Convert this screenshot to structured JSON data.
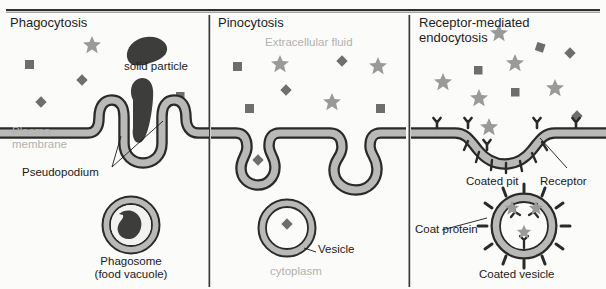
{
  "figure": {
    "type": "biology-diagram",
    "top_rule": "horizontal-rule",
    "panels": [
      {
        "id": "phagocytosis",
        "title": "Phagocytosis",
        "labels": {
          "solid_particle": "solid particle",
          "plasma_membrane": "Plasma\nmembrane",
          "pseudopodium": "Pseudopodium",
          "phagosome": "Phagosome\n(food vacuole)"
        }
      },
      {
        "id": "pinocytosis",
        "title": "Pinocytosis",
        "labels": {
          "extracellular_fluid": "Extracellular fluid",
          "vesicle": "Vesicle",
          "cytoplasm": "cytoplasm"
        }
      },
      {
        "id": "receptor-mediated-endocytosis",
        "title": "Receptor-mediated\nendocytosis",
        "labels": {
          "coated_pit": "Coated pit",
          "receptor": "Receptor",
          "coat_protein": "Coat protein",
          "coated_vesicle": "Coated vesicle"
        }
      }
    ]
  },
  "colors": {
    "ink": "#1a1a18",
    "gray_text": "#b2b2b0",
    "membrane_fill": "#b9b9b7",
    "membrane_line": "#2a2a28",
    "star": "#9a9a98",
    "square": "#6e6e6c",
    "diamond": "#6e6e6c",
    "particle_dark": "#3d3d3b",
    "divider": "#3a3a38",
    "background": "#fbfbfa"
  }
}
